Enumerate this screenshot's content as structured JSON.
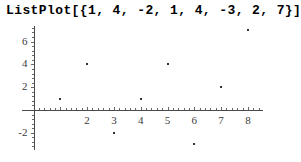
{
  "expression": "ListPlot[{1, 4, -2, 1, 4, -3, 2, 7}]",
  "chart_data": {
    "type": "scatter",
    "title": "ListPlot[{1, 4, -2, 1, 4, -3, 2, 7}]",
    "x": [
      1,
      2,
      3,
      4,
      5,
      6,
      7,
      8
    ],
    "values": [
      1,
      4,
      -2,
      1,
      4,
      -3,
      2,
      7
    ],
    "xlabel": "",
    "ylabel": "",
    "xlim": [
      0,
      8.6
    ],
    "ylim": [
      -3.4,
      7.4
    ],
    "xticks": [
      2,
      3,
      4,
      5,
      6,
      7,
      8
    ],
    "xticklabels": [
      "2",
      "3",
      "4",
      "5",
      "6",
      "7",
      "8"
    ],
    "yticks": [
      -2,
      2,
      4,
      6
    ],
    "yticklabels": [
      "-2",
      "2",
      "4",
      "6"
    ],
    "grid": false,
    "legend": null,
    "point_color": "#333333",
    "axis_color": "#4a4a4a"
  }
}
